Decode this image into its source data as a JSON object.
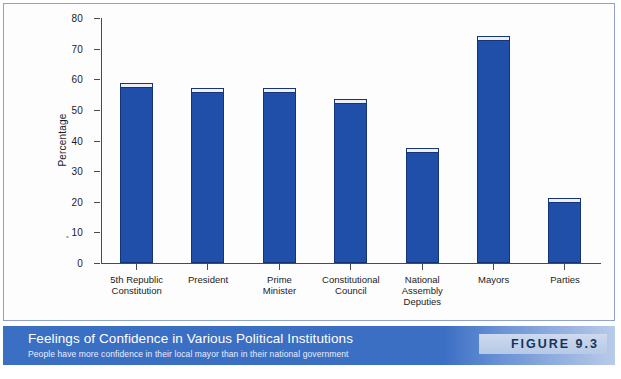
{
  "chart_data": {
    "type": "bar",
    "title": "Feelings of Confidence in Various Political Institutions",
    "subtitle": "People have more confidence in their local mayor than in their national government",
    "xlabel": "",
    "ylabel": "Percentage",
    "ylim": [
      0,
      80
    ],
    "ytick_labels": [
      "0",
      "10",
      "20",
      "30",
      "40",
      "50",
      "60",
      "70",
      "80"
    ],
    "ytick_values": [
      0,
      10,
      20,
      30,
      40,
      50,
      60,
      70,
      80
    ],
    "grid": false,
    "legend": "none",
    "bar_color": "#1f4fa8",
    "categories": [
      "5th Republic\nConstitution",
      "President",
      "Prime\nMinister",
      "Constitutional\nCouncil",
      "National\nAssembly\nDeputies",
      "Mayors",
      "Parties"
    ],
    "values": [
      57,
      55.5,
      55.5,
      52,
      36,
      72.5,
      19.5
    ]
  },
  "chart": {
    "y_axis_title": "Percentage",
    "ticks": [
      {
        "label": "80",
        "value": 80
      },
      {
        "label": "70",
        "value": 70
      },
      {
        "label": "60",
        "value": 60
      },
      {
        "label": "50",
        "value": 50
      },
      {
        "label": "40",
        "value": 40
      },
      {
        "label": "30",
        "value": 30
      },
      {
        "label": "20",
        "value": 20
      },
      {
        "label": "10",
        "value": 10
      },
      {
        "label": "0",
        "value": 0
      }
    ],
    "bars": [
      {
        "label_line1": "5th Republic",
        "label_line2": "Constitution",
        "label_line3": "",
        "value": 57
      },
      {
        "label_line1": "President",
        "label_line2": "",
        "label_line3": "",
        "value": 55.5
      },
      {
        "label_line1": "Prime",
        "label_line2": "Minister",
        "label_line3": "",
        "value": 55.5
      },
      {
        "label_line1": "Constitutional",
        "label_line2": "Council",
        "label_line3": "",
        "value": 52
      },
      {
        "label_line1": "National",
        "label_line2": "Assembly",
        "label_line3": "Deputies",
        "value": 36
      },
      {
        "label_line1": "Mayors",
        "label_line2": "",
        "label_line3": "",
        "value": 72.5
      },
      {
        "label_line1": "Parties",
        "label_line2": "",
        "label_line3": "",
        "value": 19.5
      }
    ]
  },
  "caption": {
    "title": "Feelings of Confidence in Various Political Institutions",
    "subtitle": "People have more confidence in their local mayor than in their national government",
    "figure_badge": "FIGURE 9.3"
  },
  "source": {
    "text": ""
  },
  "colors": {
    "bar_fill": "#1f4fa8",
    "bar_outline": "#16347a",
    "caption_band": "#3b6fc4",
    "badge_text": "#14335f",
    "frame_border": "#8fa2cc"
  }
}
